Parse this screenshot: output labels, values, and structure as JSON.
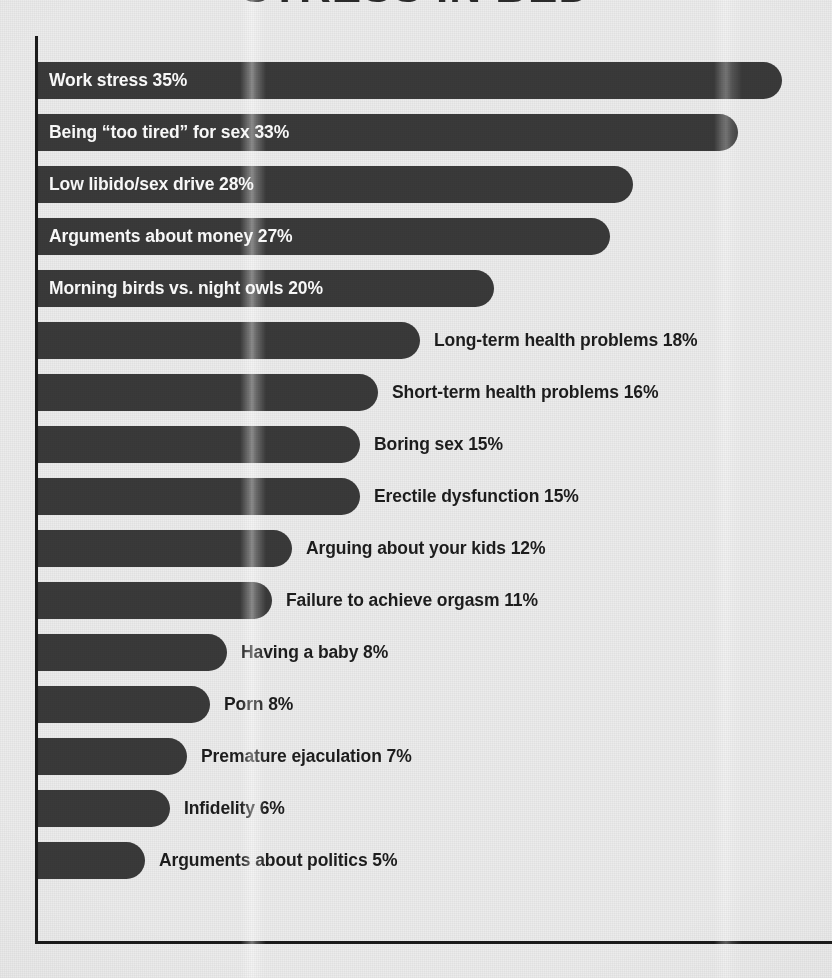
{
  "title": "STRESS IN BED",
  "colors": {
    "background": "#ececec",
    "bar": "#3a3a3a",
    "axis": "#1b1b1b",
    "label_inside": "#fdfdfd",
    "label_outside": "#1d1d1d"
  },
  "chart_data": {
    "type": "bar",
    "orientation": "horizontal",
    "title": "STRESS IN BED",
    "xlabel": "",
    "ylabel": "",
    "xlim": [
      0,
      37
    ],
    "grid": false,
    "legend": null,
    "value_suffix": "%",
    "categories": [
      "Work stress",
      "Being “too tired” for sex",
      "Low libido/sex drive",
      "Arguments about money",
      "Morning birds vs. night owls",
      "Long-term health problems",
      "Short-term health problems",
      "Boring sex",
      "Erectile dysfunction",
      "Arguing about your kids",
      "Failure to achieve orgasm",
      "Having a baby",
      "Porn",
      "Premature ejaculation",
      "Infidelity",
      "Arguments about politics"
    ],
    "values": [
      35,
      33,
      28,
      27,
      20,
      18,
      16,
      15,
      15,
      12,
      11,
      8,
      8,
      7,
      6,
      5
    ]
  },
  "rows": [
    {
      "label": "Work stress",
      "value": "35%",
      "label_position": "inside"
    },
    {
      "label": "Being “too tired” for sex",
      "value": "33%",
      "label_position": "inside"
    },
    {
      "label": "Low libido/sex drive",
      "value": "28%",
      "label_position": "inside"
    },
    {
      "label": "Arguments about money",
      "value": "27%",
      "label_position": "inside"
    },
    {
      "label": "Morning birds vs. night owls",
      "value": "20%",
      "label_position": "inside"
    },
    {
      "label": "Long-term health problems",
      "value": "18%",
      "label_position": "outside"
    },
    {
      "label": "Short-term health problems",
      "value": "16%",
      "label_position": "outside"
    },
    {
      "label": "Boring sex",
      "value": "15%",
      "label_position": "outside"
    },
    {
      "label": "Erectile dysfunction",
      "value": "15%",
      "label_position": "outside"
    },
    {
      "label": "Arguing about your kids",
      "value": "12%",
      "label_position": "outside"
    },
    {
      "label": "Failure to achieve orgasm",
      "value": "11%",
      "label_position": "outside"
    },
    {
      "label": "Having a baby",
      "value": "8%",
      "label_position": "outside"
    },
    {
      "label": "Porn",
      "value": "8%",
      "label_position": "outside"
    },
    {
      "label": "Premature ejaculation",
      "value": "7%",
      "label_position": "outside"
    },
    {
      "label": "Infidelity",
      "value": "6%",
      "label_position": "outside"
    },
    {
      "label": "Arguments about politics",
      "value": "5%",
      "label_position": "outside"
    }
  ],
  "geometry": {
    "plot_left": 35,
    "row_pitch": 52,
    "first_row_top": 54,
    "bar_ends": [
      782,
      738,
      633,
      610,
      494,
      420,
      378,
      360,
      360,
      292,
      272,
      227,
      210,
      187,
      170,
      145
    ]
  }
}
